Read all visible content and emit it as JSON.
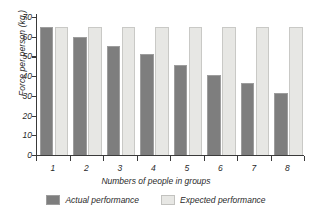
{
  "chart_data": {
    "type": "bar",
    "title": "",
    "xlabel": "Numbers of people in groups",
    "ylabel": "Force per person (kg.)",
    "categories": [
      "1",
      "2",
      "3",
      "4",
      "5",
      "6",
      "7",
      "8"
    ],
    "series": [
      {
        "name": "Actual performance",
        "color": "#7e7e7e",
        "values": [
          65,
          60,
          55.5,
          51,
          45.5,
          40.5,
          36.5,
          31.5
        ]
      },
      {
        "name": "Expected performance",
        "color": "#e7e7e4",
        "values": [
          65,
          65,
          65,
          65,
          65,
          65,
          65,
          65
        ]
      }
    ],
    "yticks": [
      0,
      10,
      20,
      30,
      40,
      50,
      60,
      70
    ],
    "ylim": [
      0,
      70
    ],
    "grid": false,
    "legend_position": "bottom"
  },
  "legend": {
    "entries": [
      {
        "label": "Actual performance",
        "swatch": "dark-gray-swatch"
      },
      {
        "label": "Expected performance",
        "swatch": "light-gray-swatch"
      }
    ]
  }
}
